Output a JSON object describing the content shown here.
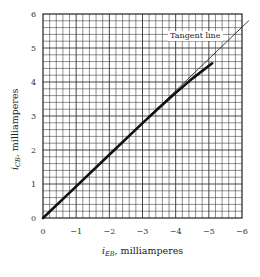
{
  "chart_data": {
    "type": "line",
    "title": "",
    "xlabel": "i_EB , milliamperes",
    "xlabel_main": "i",
    "xlabel_sub": "EB",
    "xlabel_rest": ", milliamperes",
    "ylabel": "i_CB, milliamperes",
    "ylabel_main": "i",
    "ylabel_sub": "CB",
    "ylabel_rest": ", milliamperes",
    "xlim": [
      0,
      -6
    ],
    "ylim": [
      0,
      6
    ],
    "x_ticks": [
      "0",
      "−1",
      "−2",
      "−3",
      "−4",
      "−5",
      "−6"
    ],
    "y_ticks": [
      "0",
      "1",
      "2",
      "3",
      "4",
      "5",
      "6"
    ],
    "grid": true,
    "minor_divisions_per_unit": 5,
    "series": [
      {
        "name": "Measured characteristic",
        "style": "thick solid",
        "x": [
          0,
          -1,
          -2,
          -3,
          -3.5,
          -4,
          -4.5,
          -5.1
        ],
        "y": [
          0,
          0.93,
          1.86,
          2.79,
          3.24,
          3.68,
          4.1,
          4.55
        ]
      },
      {
        "name": "Tangent line",
        "style": "thin solid",
        "x": [
          0,
          -6.2
        ],
        "y": [
          0,
          5.8
        ]
      }
    ],
    "annotations": [
      {
        "text": "Tangent line",
        "x": -4.2,
        "y": 5.4
      }
    ]
  }
}
